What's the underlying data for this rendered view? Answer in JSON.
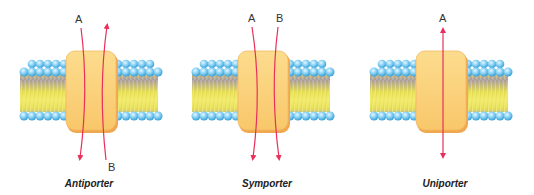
{
  "diagram": {
    "panels": [
      {
        "name": "antiporter",
        "caption": "Antiporter",
        "labels": {
          "top": "A",
          "bottom": "B"
        },
        "flows": [
          {
            "molecule": "A",
            "direction": "inward (top to bottom)"
          },
          {
            "molecule": "B",
            "direction": "outward (bottom to top)"
          }
        ]
      },
      {
        "name": "symporter",
        "caption": "Symporter",
        "labels": {
          "top_left": "A",
          "top_right": "B"
        },
        "flows": [
          {
            "molecule": "A",
            "direction": "top to bottom"
          },
          {
            "molecule": "B",
            "direction": "top to bottom"
          }
        ]
      },
      {
        "name": "uniporter",
        "caption": "Uniporter",
        "labels": {
          "top": "A"
        },
        "flows": [
          {
            "molecule": "A",
            "direction": "bidirectional"
          }
        ]
      }
    ],
    "colors": {
      "protein_fill": "#fbd27a",
      "protein_edge": "#f0a850",
      "lipid_head": "#6cc3ee",
      "lipid_tail": "#e8e04a",
      "arrow": "#e8305a"
    }
  }
}
